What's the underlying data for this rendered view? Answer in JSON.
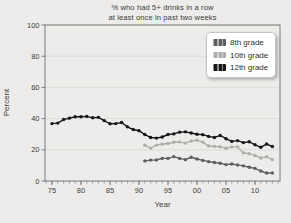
{
  "title_line1": "% who had 5+ drinks in a row",
  "title_line2": "at least once in past two weeks",
  "chart_data": {
    "type": "line",
    "title": "% who had 5+ drinks in a row at least once in past two weeks",
    "xlabel": "Year",
    "ylabel": "Percent",
    "ylim": [
      0,
      100
    ],
    "xlim": [
      1974,
      2014.5
    ],
    "yticks": [
      0,
      20,
      40,
      60,
      80,
      100
    ],
    "xticks": [
      1975,
      1980,
      1985,
      1990,
      1995,
      2000,
      2005,
      2010
    ],
    "xtick_labels": [
      "75",
      "80",
      "85",
      "90",
      "95",
      "00",
      "05",
      "10"
    ],
    "grid": true,
    "legend_position": "top-right",
    "frame_color": "#7a7a78",
    "grid_color": "#d9d8d4",
    "tick_label_color": "#3c3c3c",
    "series": [
      {
        "name": "8th grade",
        "color": "#5e5e5e",
        "x": [
          1991,
          1992,
          1993,
          1994,
          1995,
          1996,
          1997,
          1998,
          1999,
          2000,
          2001,
          2002,
          2003,
          2004,
          2005,
          2006,
          2007,
          2008,
          2009,
          2010,
          2011,
          2012,
          2013
        ],
        "y": [
          12.9,
          13.4,
          13.5,
          14.5,
          14.5,
          15.6,
          14.5,
          13.7,
          15.2,
          14.1,
          13.2,
          12.4,
          11.9,
          11.4,
          10.5,
          10.9,
          10.3,
          9.7,
          8.8,
          8.1,
          6.4,
          5.1,
          5.1
        ]
      },
      {
        "name": "10th grade",
        "color": "#aeadaa",
        "x": [
          1991,
          1992,
          1993,
          1994,
          1995,
          1996,
          1997,
          1998,
          1999,
          2000,
          2001,
          2002,
          2003,
          2004,
          2005,
          2006,
          2007,
          2008,
          2009,
          2010,
          2011,
          2012,
          2013
        ],
        "y": [
          22.9,
          21.1,
          23.0,
          23.6,
          24.0,
          24.8,
          25.1,
          24.3,
          25.6,
          26.2,
          24.9,
          22.4,
          22.2,
          22.0,
          21.0,
          21.9,
          21.9,
          18.0,
          17.5,
          16.3,
          14.7,
          15.6,
          13.7
        ]
      },
      {
        "name": "12th grade",
        "color": "#161616",
        "x": [
          1975,
          1976,
          1977,
          1978,
          1979,
          1980,
          1981,
          1982,
          1983,
          1984,
          1985,
          1986,
          1987,
          1988,
          1989,
          1990,
          1991,
          1992,
          1993,
          1994,
          1995,
          1996,
          1997,
          1998,
          1999,
          2000,
          2001,
          2002,
          2003,
          2004,
          2005,
          2006,
          2007,
          2008,
          2009,
          2010,
          2011,
          2012,
          2013
        ],
        "y": [
          36.8,
          37.1,
          39.4,
          40.3,
          41.2,
          41.2,
          41.4,
          40.5,
          40.8,
          38.7,
          36.7,
          36.8,
          37.5,
          34.7,
          33.0,
          32.2,
          29.8,
          27.9,
          27.5,
          28.2,
          29.8,
          30.2,
          31.3,
          31.5,
          30.8,
          30.0,
          29.7,
          28.6,
          27.9,
          29.2,
          27.1,
          25.4,
          25.9,
          24.6,
          25.2,
          23.2,
          21.6,
          23.7,
          22.1
        ]
      }
    ]
  }
}
